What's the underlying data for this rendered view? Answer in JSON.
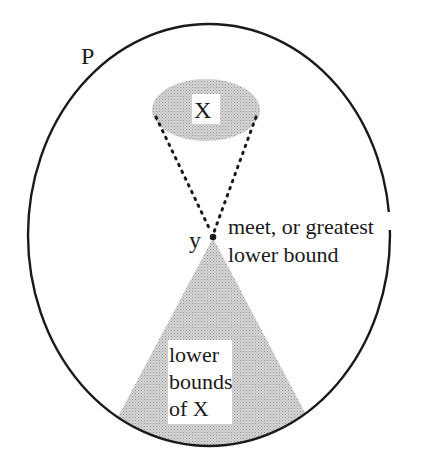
{
  "diagram": {
    "set_label": "P",
    "subset_label": "X",
    "point_label": "y",
    "meet_label_line1": "meet, or greatest",
    "meet_label_line2": "lower bound",
    "lower_bounds_line1": "lower",
    "lower_bounds_line2": "bounds",
    "lower_bounds_line3": "of X"
  },
  "colors": {
    "outline": "#1a1a1a",
    "shade": "#c8c8c8",
    "background": "#ffffff"
  }
}
